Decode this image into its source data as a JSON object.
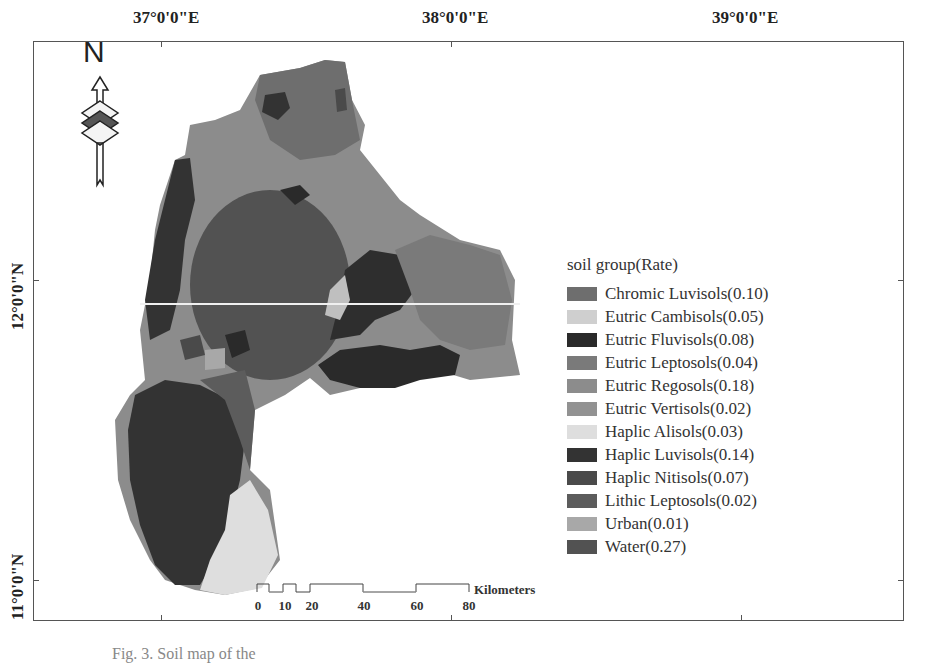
{
  "map": {
    "type": "soil map",
    "longitude_labels": [
      "37°0'0\"E",
      "38°0'0\"E",
      "39°0'0\"E"
    ],
    "latitude_labels": [
      "12°0'0\"N",
      "11°0'0\"N"
    ],
    "north_arrow": {
      "label": "N",
      "icon": "north-arrow-icon"
    },
    "scale_bar": {
      "ticks": [
        "0",
        "10",
        "20",
        "40",
        "60",
        "80"
      ],
      "unit": "Kilometers"
    }
  },
  "legend": {
    "title": "soil group(Rate)",
    "items": [
      {
        "label": "Chromic Luvisols(0.10)",
        "color": "#6e6e6e"
      },
      {
        "label": "Eutric Cambisols(0.05)",
        "color": "#cfcfcf"
      },
      {
        "label": "Eutric Fluvisols(0.08)",
        "color": "#2a2a2a"
      },
      {
        "label": "Eutric Leptosols(0.04)",
        "color": "#7a7a7a"
      },
      {
        "label": "Eutric Regosols(0.18)",
        "color": "#8c8c8c"
      },
      {
        "label": "Eutric Vertisols(0.02)",
        "color": "#929292"
      },
      {
        "label": "Haplic Alisols(0.03)",
        "color": "#dedede"
      },
      {
        "label": "Haplic Luvisols(0.14)",
        "color": "#333333"
      },
      {
        "label": "Haplic Nitisols(0.07)",
        "color": "#4a4a4a"
      },
      {
        "label": "Lithic Leptosols(0.02)",
        "color": "#5c5c5c"
      },
      {
        "label": "Urban(0.01)",
        "color": "#a8a8a8"
      },
      {
        "label": "Water(0.27)",
        "color": "#525252"
      }
    ]
  },
  "caption": "Fig. 3. Soil map of the"
}
